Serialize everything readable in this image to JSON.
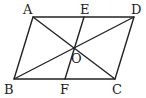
{
  "diagram": {
    "type": "parallelogram-with-diagonals",
    "stroke_color": "#222222",
    "background": "#ffffff",
    "points": {
      "A": {
        "x": 33,
        "y": 17
      },
      "D": {
        "x": 134,
        "y": 17
      },
      "B": {
        "x": 14,
        "y": 79
      },
      "C": {
        "x": 115,
        "y": 79
      },
      "E": {
        "x": 84,
        "y": 17
      },
      "F": {
        "x": 65,
        "y": 79
      },
      "O": {
        "x": 74,
        "y": 48
      }
    },
    "labels": {
      "A": "A",
      "E": "E",
      "D": "D",
      "O": "O",
      "B": "B",
      "F": "F",
      "C": "C"
    },
    "segments": [
      "AD",
      "DC",
      "CB",
      "BA",
      "AC",
      "BD",
      "EF"
    ]
  }
}
